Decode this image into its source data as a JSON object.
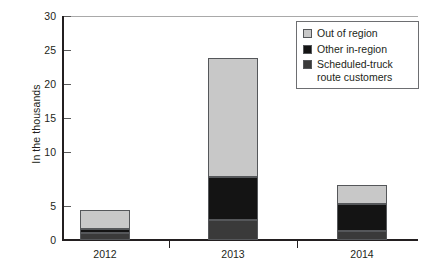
{
  "chart_data": {
    "type": "bar",
    "title": "",
    "subtitle": "",
    "xlabel": "",
    "ylabel": "In the thousands",
    "categories": [
      "2012",
      "2013",
      "2014"
    ],
    "ylim": [
      0,
      30
    ],
    "yticks": [
      0,
      5,
      10,
      15,
      20,
      25,
      30
    ],
    "ytick_labels": [
      "0",
      "5",
      "10",
      "15",
      "20",
      "25",
      "30"
    ],
    "grid": false,
    "stacked": true,
    "legend_position": "top-right",
    "series": [
      {
        "name": "Scheduled-truck route customers",
        "color": "#3a3a3a",
        "values": [
          1.0,
          2.7,
          1.2
        ]
      },
      {
        "name": "Other in-region",
        "color": "#141414",
        "values": [
          0.5,
          5.8,
          3.6
        ]
      },
      {
        "name": "Out of region",
        "color": "#c8c8c8",
        "values": [
          2.5,
          15.9,
          2.5
        ]
      }
    ],
    "totals": [
      4.0,
      24.4,
      7.3
    ]
  },
  "legend": {
    "entries": [
      {
        "label": "Out of region",
        "color": "#c8c8c8"
      },
      {
        "label": "Other in-region",
        "color": "#141414"
      },
      {
        "label": "Scheduled-truck route customers",
        "color": "#3a3a3a"
      }
    ]
  },
  "axis": {
    "y_title": "In the thousands",
    "y_labels": [
      "30",
      "25",
      "20",
      "15",
      "10",
      "5",
      "0"
    ],
    "x_labels": [
      "2012",
      "2013",
      "2014"
    ]
  }
}
